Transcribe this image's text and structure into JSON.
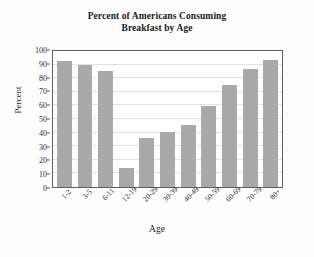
{
  "chart_data": {
    "type": "bar",
    "title": "Percent of Americans Consuming Breakfast by Age",
    "title_lines": [
      "Percent of Americans Consuming",
      "Breakfast by Age"
    ],
    "xlabel": "Age",
    "ylabel": "Percent",
    "categories": [
      "1-2",
      "3-5",
      "6-11",
      "12-19",
      "20-29",
      "30-39",
      "40-49",
      "50-59",
      "60-69",
      "70-79",
      "80+"
    ],
    "values": [
      93,
      90,
      85,
      14,
      36,
      40.5,
      45.5,
      59.5,
      75,
      86.5,
      93.5
    ],
    "ylim": [
      0,
      100
    ],
    "yticks": [
      0,
      10,
      20,
      30,
      40,
      50,
      60,
      70,
      80,
      90,
      100
    ],
    "ytick_labels": [
      "0",
      "10",
      "20",
      "30",
      "40",
      "50",
      "60",
      "70",
      "80",
      "90",
      "100"
    ],
    "grid": "horizontal",
    "legend": "none",
    "bar_color": "#a9a9a9",
    "frame_color": "#5e5e5e",
    "grid_color": "#e2e2e2",
    "background_color": "#fdfdfd"
  }
}
